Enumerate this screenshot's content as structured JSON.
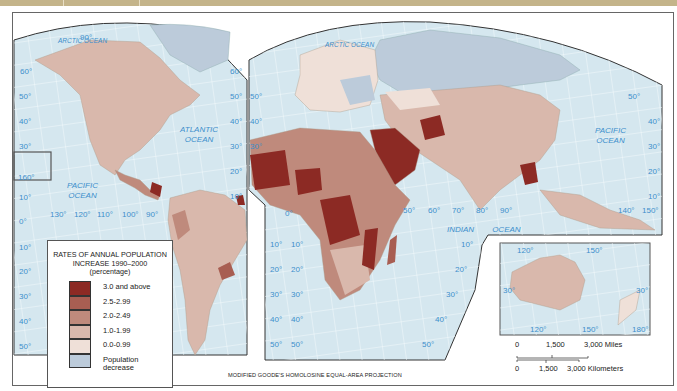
{
  "map": {
    "projection_label": "MODIFIED GOODE'S HOMOLOSINE EQUAL-AREA PROJECTION",
    "oceans": {
      "arctic_west": "ARCTIC OCEAN",
      "arctic_east": "ARCTIC OCEAN",
      "atlantic": [
        "ATLANTIC",
        "OCEAN"
      ],
      "pacific_west": [
        "PACIFIC",
        "OCEAN"
      ],
      "pacific_east": [
        "PACIFIC",
        "OCEAN"
      ],
      "indian": [
        "INDIAN",
        "OCEAN"
      ]
    },
    "lat_labels_west": [
      "60°",
      "50°",
      "40°",
      "30°",
      "160°",
      "10°",
      "0°",
      "10°",
      "20°",
      "30°",
      "40°",
      "50°"
    ],
    "lat_labels_mid": [
      "80°",
      "60°",
      "50°",
      "40°",
      "30°",
      "20°",
      "10°"
    ],
    "lon_labels_pacific": [
      "130°",
      "120°",
      "110°",
      "100°",
      "90°"
    ],
    "north_pole_label": "90°",
    "africa_lat_labels": [
      "50°",
      "40°",
      "30°",
      "0°",
      "10°",
      "20°",
      "30°",
      "40°",
      "50°"
    ],
    "indian_lon_labels": [
      "50°",
      "60°",
      "70°",
      "80°",
      "90°"
    ],
    "indian_lat_labels": [
      "10°",
      "20°",
      "30°",
      "40°",
      "50°"
    ],
    "east_lat_labels": [
      "50°",
      "40°",
      "30°",
      "20°",
      "10°"
    ],
    "east_lon_labels": [
      "140°",
      "150°"
    ],
    "australia_inset": {
      "top_labels": [
        "120°",
        "150°"
      ],
      "side_labels": [
        "30°",
        "30°"
      ],
      "bottom_labels": [
        "120°",
        "150°",
        "180°"
      ]
    }
  },
  "legend": {
    "title_line1": "RATES OF ANNUAL POPULATION",
    "title_line2": "INCREASE 1990–2000",
    "title_line3": "(percentage)",
    "items": [
      {
        "label": "3.0 and above",
        "color": "#8c2a24"
      },
      {
        "label": "2.5-2.99",
        "color": "#a85e52"
      },
      {
        "label": "2.0-2.49",
        "color": "#bf8a7c"
      },
      {
        "label": "1.0-1.99",
        "color": "#d9b8ac"
      },
      {
        "label": "0.0-0.99",
        "color": "#efe0d8"
      },
      {
        "label": "Population",
        "label2": "decrease",
        "color": "#bccbda"
      }
    ]
  },
  "scale": {
    "miles": [
      "0",
      "1,500",
      "3,000 Miles"
    ],
    "km": [
      "0",
      "1,500",
      "3,000 Kilometers"
    ]
  },
  "colors": {
    "ocean": "#d5e7ef",
    "grid": "#f4fafc",
    "label_blue": "#3d8fcc",
    "topbar": "#c4b48a"
  }
}
